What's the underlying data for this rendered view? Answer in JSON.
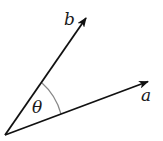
{
  "diagram": {
    "type": "vector-angle",
    "vectors": [
      {
        "name": "b",
        "label": "b",
        "from": [
          5,
          135
        ],
        "to": [
          87,
          17
        ]
      },
      {
        "name": "a",
        "label": "a",
        "from": [
          5,
          135
        ],
        "to": [
          149,
          81
        ]
      }
    ],
    "angle": {
      "label": "θ",
      "between": [
        "a",
        "b"
      ]
    },
    "colors": {
      "stroke": "#111111",
      "arc": "#777777",
      "background": "#ffffff"
    }
  },
  "labels": {
    "b": "b",
    "a": "a",
    "theta": "θ"
  }
}
